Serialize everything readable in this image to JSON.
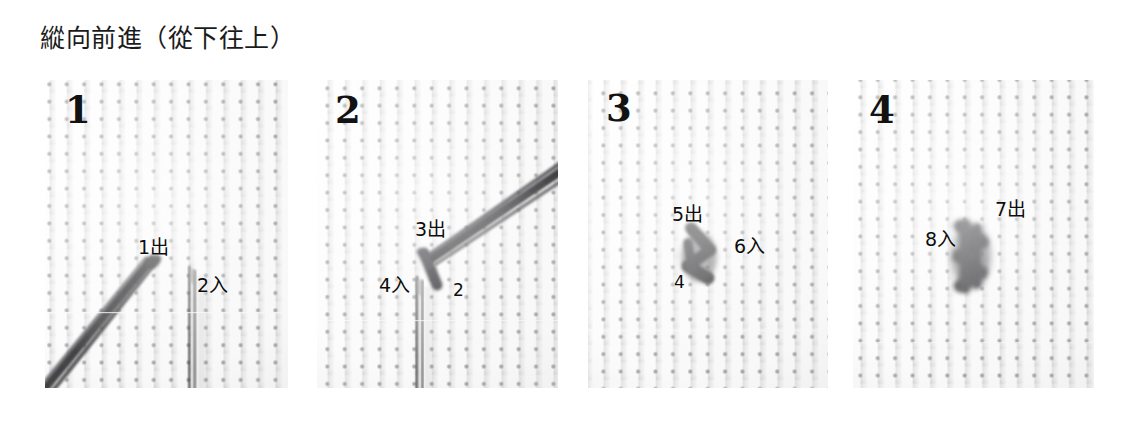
{
  "title": "縱向前進（從下往上）",
  "panels": [
    {
      "number": "1",
      "name": "step-1",
      "labels": [
        {
          "text": "1出",
          "x": 93,
          "y": 158
        },
        {
          "text": "2入",
          "x": 152,
          "y": 196
        }
      ]
    },
    {
      "number": "2",
      "name": "step-2",
      "labels": [
        {
          "text": "3出",
          "x": 98,
          "y": 140
        },
        {
          "text": "4入",
          "x": 62,
          "y": 196
        },
        {
          "text": "2",
          "x": 136,
          "y": 202
        }
      ]
    },
    {
      "number": "3",
      "name": "step-3",
      "labels": [
        {
          "text": "5出",
          "x": 84,
          "y": 125
        },
        {
          "text": "6入",
          "x": 146,
          "y": 157
        },
        {
          "text": "4",
          "x": 86,
          "y": 194
        }
      ]
    },
    {
      "number": "4",
      "name": "step-4",
      "labels": [
        {
          "text": "7出",
          "x": 142,
          "y": 120
        },
        {
          "text": "8入",
          "x": 72,
          "y": 150
        }
      ]
    }
  ],
  "layout": {
    "panel_tops": 80,
    "panel_height": 308,
    "panel_lefts": [
      45,
      317,
      588,
      853
    ],
    "panel_widths": [
      243,
      241,
      240,
      241
    ],
    "number_offsets": [
      {
        "x": 20,
        "y": 12
      },
      {
        "x": 18,
        "y": 12
      },
      {
        "x": 18,
        "y": 10
      },
      {
        "x": 16,
        "y": 12
      }
    ]
  },
  "colors": {
    "fabric": "#f2f2f0",
    "thread": "#2a2a2c",
    "text": "#0d0d0d",
    "needle": "#2f2f31",
    "background": "#ffffff"
  }
}
